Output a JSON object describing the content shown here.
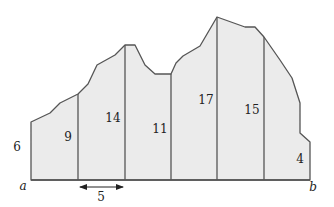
{
  "figure": {
    "endpoints": {
      "left": "a",
      "right": "b"
    },
    "strip_width_label": "5",
    "heights": [
      "6",
      "9",
      "14",
      "11",
      "17",
      "15",
      "4"
    ],
    "colors": {
      "fill": "#ebebeb",
      "stroke": "#555555",
      "text": "#222222"
    }
  }
}
